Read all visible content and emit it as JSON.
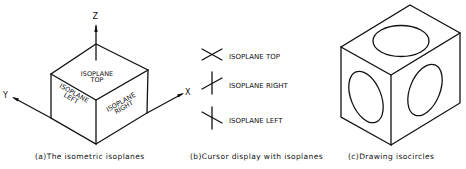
{
  "figure_a": {
    "axis_labels": {
      "z": "Z",
      "y": "Y",
      "x": "X"
    },
    "faces": {
      "top": [
        "ISOPLANE",
        "TOP"
      ],
      "left": [
        "ISOPLANE",
        "LEFT"
      ],
      "right": [
        "ISOPLANE",
        "RIGHT"
      ]
    },
    "caption": "(a)The isometric isoplanes"
  },
  "figure_b": {
    "cursors": [
      {
        "icon": "isoplane-top-cursor-icon",
        "label": "ISOPLANE TOP"
      },
      {
        "icon": "isoplane-right-cursor-icon",
        "label": "ISOPLANE RIGHT"
      },
      {
        "icon": "isoplane-left-cursor-icon",
        "label": "ISOPLANE LEFT"
      }
    ],
    "caption": "(b)Cursor display with isoplanes"
  },
  "figure_c": {
    "caption": "(c)Drawing isocircles"
  },
  "colors": {
    "line": "#111111",
    "background": "#ffffff"
  }
}
